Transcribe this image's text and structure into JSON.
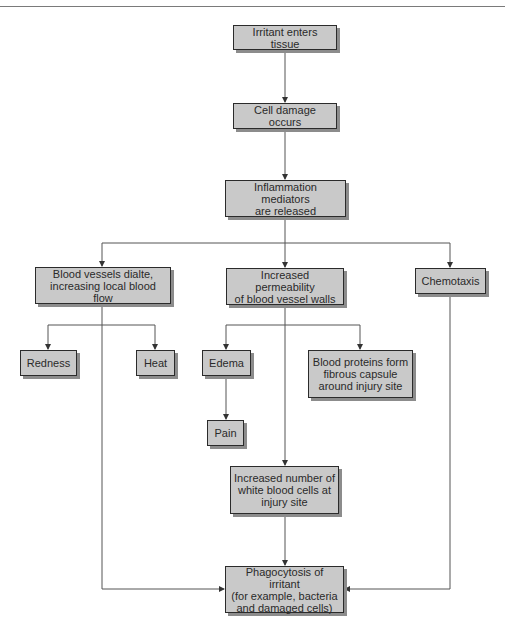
{
  "diagram": {
    "type": "flowchart",
    "nodes": {
      "irritant": "Irritant enters tissue",
      "cell_damage": "Cell damage occurs",
      "mediators": "Inflammation mediators\nare released",
      "vessels_dilate": "Blood vessels dialte,\nincreasing local blood flow",
      "permeability": "Increased permeability\nof blood vessel walls",
      "chemotaxis": "Chemotaxis",
      "redness": "Redness",
      "heat": "Heat",
      "edema": "Edema",
      "proteins": "Blood proteins form\nfibrous capsule\naround injury site",
      "pain": "Pain",
      "wbc": "Increased number of\nwhite blood cells at\ninjury site",
      "phagocytosis": "Phagocytosis of irritant\n(for example, bacteria\nand damaged cells)"
    },
    "edges": [
      [
        "irritant",
        "cell_damage"
      ],
      [
        "cell_damage",
        "mediators"
      ],
      [
        "mediators",
        "vessels_dilate"
      ],
      [
        "mediators",
        "permeability"
      ],
      [
        "mediators",
        "chemotaxis"
      ],
      [
        "vessels_dilate",
        "redness"
      ],
      [
        "vessels_dilate",
        "heat"
      ],
      [
        "vessels_dilate",
        "phagocytosis"
      ],
      [
        "permeability",
        "edema"
      ],
      [
        "permeability",
        "proteins"
      ],
      [
        "permeability",
        "wbc"
      ],
      [
        "edema",
        "pain"
      ],
      [
        "wbc",
        "phagocytosis"
      ],
      [
        "chemotaxis",
        "phagocytosis"
      ]
    ],
    "colors": {
      "box_fill": "#c9c9c9",
      "box_border": "#2b2b2b",
      "box_shadow": "#8c8c8c",
      "line": "#555555"
    }
  }
}
